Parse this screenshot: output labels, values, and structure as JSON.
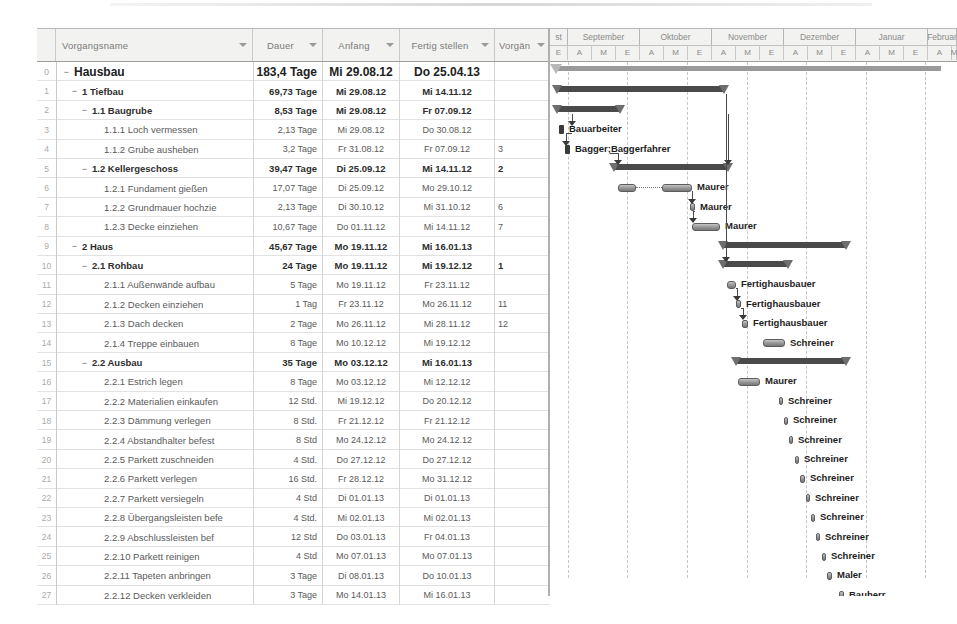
{
  "app": {
    "title": "Projektplan Hausbau - Gantt-Diagramm"
  },
  "table": {
    "columns": [
      {
        "key": "name",
        "label": "Vorgangsname",
        "filter_icon": "chevron-down-icon"
      },
      {
        "key": "dauer",
        "label": "Dauer",
        "filter_icon": "chevron-down-icon"
      },
      {
        "key": "anf",
        "label": "Anfang",
        "filter_icon": "chevron-down-icon"
      },
      {
        "key": "fert",
        "label": "Fertig stellen",
        "filter_icon": "chevron-down-icon"
      },
      {
        "key": "vorg",
        "label": "Vorgän",
        "filter_icon": "chevron-down-icon"
      }
    ],
    "rows": [
      {
        "idx": "0",
        "level": 0,
        "twist": "−",
        "name": "Hausbau",
        "dauer": "183,4 Tage",
        "anf": "Mi 29.08.12",
        "fert": "Do 25.04.13",
        "vorg": ""
      },
      {
        "idx": "1",
        "level": 1,
        "twist": "−",
        "name": "1 Tiefbau",
        "dauer": "69,73 Tage",
        "anf": "Mi 29.08.12",
        "fert": "Mi 14.11.12",
        "vorg": ""
      },
      {
        "idx": "2",
        "level": 2,
        "twist": "−",
        "name": "1.1 Baugrube",
        "dauer": "8,53 Tage",
        "anf": "Mi 29.08.12",
        "fert": "Fr 07.09.12",
        "vorg": ""
      },
      {
        "idx": "3",
        "level": 3,
        "twist": "",
        "name": "1.1.1 Loch vermessen",
        "dauer": "2,13 Tage",
        "anf": "Mi 29.08.12",
        "fert": "Do 30.08.12",
        "vorg": ""
      },
      {
        "idx": "4",
        "level": 3,
        "twist": "",
        "name": "1.1.2 Grube ausheben",
        "dauer": "3,2 Tage",
        "anf": "Fr 31.08.12",
        "fert": "Fr 07.09.12",
        "vorg": "3"
      },
      {
        "idx": "5",
        "level": 2,
        "twist": "−",
        "name": "1.2 Kellergeschoss",
        "dauer": "39,47 Tage",
        "anf": "Di 25.09.12",
        "fert": "Mi 14.11.12",
        "vorg": "2"
      },
      {
        "idx": "6",
        "level": 3,
        "twist": "",
        "name": "1.2.1 Fundament gießen",
        "dauer": "17,07 Tage",
        "anf": "Di 25.09.12",
        "fert": "Mo 29.10.12",
        "vorg": ""
      },
      {
        "idx": "7",
        "level": 3,
        "twist": "",
        "name": "1.2.2 Grundmauer hochzie",
        "dauer": "2,13 Tage",
        "anf": "Di 30.10.12",
        "fert": "Mi 31.10.12",
        "vorg": "6"
      },
      {
        "idx": "8",
        "level": 3,
        "twist": "",
        "name": "1.2.3 Decke einziehen",
        "dauer": "10,67 Tage",
        "anf": "Do 01.11.12",
        "fert": "Mi 14.11.12",
        "vorg": "7"
      },
      {
        "idx": "9",
        "level": 1,
        "twist": "−",
        "name": "2 Haus",
        "dauer": "45,67 Tage",
        "anf": "Mo 19.11.12",
        "fert": "Mi 16.01.13",
        "vorg": ""
      },
      {
        "idx": "10",
        "level": 2,
        "twist": "−",
        "name": "2.1 Rohbau",
        "dauer": "24 Tage",
        "anf": "Mo 19.11.12",
        "fert": "Mi 19.12.12",
        "vorg": "1"
      },
      {
        "idx": "11",
        "level": 3,
        "twist": "",
        "name": "2.1.1 Außenwände aufbau",
        "dauer": "5 Tage",
        "anf": "Mo 19.11.12",
        "fert": "Fr 23.11.12",
        "vorg": ""
      },
      {
        "idx": "12",
        "level": 3,
        "twist": "",
        "name": "2.1.2 Decken einziehen",
        "dauer": "1 Tag",
        "anf": "Fr 23.11.12",
        "fert": "Mo 26.11.12",
        "vorg": "11"
      },
      {
        "idx": "13",
        "level": 3,
        "twist": "",
        "name": "2.1.3 Dach decken",
        "dauer": "2 Tage",
        "anf": "Mo 26.11.12",
        "fert": "Mi 28.11.12",
        "vorg": "12"
      },
      {
        "idx": "14",
        "level": 3,
        "twist": "",
        "name": "2.1.4 Treppe einbauen",
        "dauer": "8 Tage",
        "anf": "Mo 10.12.12",
        "fert": "Mi 19.12.12",
        "vorg": ""
      },
      {
        "idx": "15",
        "level": 2,
        "twist": "−",
        "name": "2.2 Ausbau",
        "dauer": "35 Tage",
        "anf": "Mo 03.12.12",
        "fert": "Mi 16.01.13",
        "vorg": ""
      },
      {
        "idx": "16",
        "level": 3,
        "twist": "",
        "name": "2.2.1 Estrich legen",
        "dauer": "8 Tage",
        "anf": "Mo 03.12.12",
        "fert": "Mi 12.12.12",
        "vorg": ""
      },
      {
        "idx": "17",
        "level": 3,
        "twist": "",
        "name": "2.2.2 Materialien einkaufen",
        "dauer": "12 Std.",
        "anf": "Mi 19.12.12",
        "fert": "Do 20.12.12",
        "vorg": ""
      },
      {
        "idx": "18",
        "level": 3,
        "twist": "",
        "name": "2.2.3 Dämmung verlegen",
        "dauer": "8 Std.",
        "anf": "Fr 21.12.12",
        "fert": "Fr 21.12.12",
        "vorg": ""
      },
      {
        "idx": "19",
        "level": 3,
        "twist": "",
        "name": "2.2.4 Abstandhalter befest",
        "dauer": "8 Std",
        "anf": "Mo 24.12.12",
        "fert": "Mo 24.12.12",
        "vorg": ""
      },
      {
        "idx": "20",
        "level": 3,
        "twist": "",
        "name": "2.2.5 Parkett zuschneiden",
        "dauer": "4 Std.",
        "anf": "Do 27.12.12",
        "fert": "Do 27.12.12",
        "vorg": ""
      },
      {
        "idx": "21",
        "level": 3,
        "twist": "",
        "name": "2.2.6 Parkett verlegen",
        "dauer": "16 Std.",
        "anf": "Fr 28.12.12",
        "fert": "Mo 31.12.12",
        "vorg": ""
      },
      {
        "idx": "22",
        "level": 3,
        "twist": "",
        "name": "2.2.7 Parkett versiegeln",
        "dauer": "4 Std",
        "anf": "Di 01.01.13",
        "fert": "Di 01.01.13",
        "vorg": ""
      },
      {
        "idx": "23",
        "level": 3,
        "twist": "",
        "name": "2.2.8 Übergangsleisten befe",
        "dauer": "4 Std.",
        "anf": "Mi 02.01.13",
        "fert": "Mi 02.01.13",
        "vorg": ""
      },
      {
        "idx": "24",
        "level": 3,
        "twist": "",
        "name": "2.2.9 Abschlussleisten bef",
        "dauer": "12 Std",
        "anf": "Do 03.01.13",
        "fert": "Fr 04.01.13",
        "vorg": ""
      },
      {
        "idx": "25",
        "level": 3,
        "twist": "",
        "name": "2.2.10 Parkett reinigen",
        "dauer": "4 Std",
        "anf": "Mo 07.01.13",
        "fert": "Mo 07.01.13",
        "vorg": ""
      },
      {
        "idx": "26",
        "level": 3,
        "twist": "",
        "name": "2.2.11 Tapeten anbringen",
        "dauer": "3 Tage",
        "anf": "Di 08.01.13",
        "fert": "Do 10.01.13",
        "vorg": ""
      },
      {
        "idx": "27",
        "level": 3,
        "twist": "",
        "name": "2.2.12 Decken verkleiden",
        "dauer": "3 Tage",
        "anf": "Mo 14.01.13",
        "fert": "Mi 16.01.13",
        "vorg": ""
      }
    ]
  },
  "gantt": {
    "timeline": {
      "months": [
        {
          "label": "st",
          "left": 0,
          "width": 18
        },
        {
          "label": "September",
          "left": 18,
          "width": 72
        },
        {
          "label": "Oktober",
          "left": 90,
          "width": 72
        },
        {
          "label": "November",
          "left": 162,
          "width": 72
        },
        {
          "label": "Dezember",
          "left": 234,
          "width": 72
        },
        {
          "label": "Januar",
          "left": 306,
          "width": 72
        },
        {
          "label": "Februar",
          "left": 378,
          "width": 29
        }
      ],
      "periods": [
        {
          "label": "E",
          "left": 0,
          "width": 18
        },
        {
          "label": "A",
          "left": 18,
          "width": 24
        },
        {
          "label": "M",
          "left": 42,
          "width": 24
        },
        {
          "label": "E",
          "left": 66,
          "width": 24
        },
        {
          "label": "A",
          "left": 90,
          "width": 24
        },
        {
          "label": "M",
          "left": 114,
          "width": 24
        },
        {
          "label": "E",
          "left": 138,
          "width": 24
        },
        {
          "label": "A",
          "left": 162,
          "width": 24
        },
        {
          "label": "M",
          "left": 186,
          "width": 24
        },
        {
          "label": "E",
          "left": 210,
          "width": 24
        },
        {
          "label": "A",
          "left": 234,
          "width": 24
        },
        {
          "label": "M",
          "left": 258,
          "width": 24
        },
        {
          "label": "E",
          "left": 282,
          "width": 24
        },
        {
          "label": "A",
          "left": 306,
          "width": 24
        },
        {
          "label": "M",
          "left": 330,
          "width": 24
        },
        {
          "label": "E",
          "left": 354,
          "width": 24
        },
        {
          "label": "A",
          "left": 378,
          "width": 24
        },
        {
          "label": "M",
          "left": 402,
          "width": 5
        }
      ],
      "gridlines": [
        18,
        77,
        137,
        197,
        256,
        316,
        375
      ]
    },
    "bars": [
      {
        "row": 0,
        "type": "project",
        "left": 6,
        "width": 385,
        "label": ""
      },
      {
        "row": 1,
        "type": "summary",
        "left": 7,
        "width": 167,
        "label": ""
      },
      {
        "row": 2,
        "type": "summary",
        "left": 7,
        "width": 63,
        "label": ""
      },
      {
        "row": 3,
        "type": "milestone",
        "left": 9,
        "width": 5,
        "label": "Bauarbeiter"
      },
      {
        "row": 4,
        "type": "milestone",
        "left": 15,
        "width": 5,
        "label": "Bagger;Baggerfahrer"
      },
      {
        "row": 5,
        "type": "summary",
        "left": 64,
        "width": 114,
        "label": ""
      },
      {
        "row": 6,
        "type": "task",
        "left": 68,
        "width": 18,
        "label": "Maurer",
        "dotted": true,
        "dot_left": 86,
        "dot_width": 26,
        "bar2_left": 112,
        "bar2_width": 30
      },
      {
        "row": 7,
        "type": "task",
        "left": 140,
        "width": 5,
        "label": "Maurer"
      },
      {
        "row": 8,
        "type": "task",
        "left": 142,
        "width": 28,
        "label": "Maurer"
      },
      {
        "row": 9,
        "type": "summary",
        "left": 173,
        "width": 123,
        "label": ""
      },
      {
        "row": 10,
        "type": "summary",
        "left": 173,
        "width": 65,
        "label": ""
      },
      {
        "row": 11,
        "type": "task",
        "left": 177,
        "width": 9,
        "label": "Fertighausbauer"
      },
      {
        "row": 12,
        "type": "task",
        "left": 186,
        "width": 5,
        "label": "Fertighausbauer"
      },
      {
        "row": 13,
        "type": "task",
        "left": 192,
        "width": 6,
        "label": "Fertighausbauer"
      },
      {
        "row": 14,
        "type": "task",
        "left": 213,
        "width": 22,
        "label": "Schreiner"
      },
      {
        "row": 15,
        "type": "summary",
        "left": 186,
        "width": 110,
        "label": ""
      },
      {
        "row": 16,
        "type": "task",
        "left": 188,
        "width": 22,
        "label": "Maurer"
      },
      {
        "row": 17,
        "type": "task",
        "left": 229,
        "width": 4,
        "label": "Schreiner"
      },
      {
        "row": 18,
        "type": "task",
        "left": 234,
        "width": 4,
        "label": "Schreiner"
      },
      {
        "row": 19,
        "type": "task",
        "left": 239,
        "width": 4,
        "label": "Schreiner"
      },
      {
        "row": 20,
        "type": "task",
        "left": 245,
        "width": 4,
        "label": "Schreiner"
      },
      {
        "row": 21,
        "type": "task",
        "left": 250,
        "width": 5,
        "label": "Schreiner"
      },
      {
        "row": 22,
        "type": "task",
        "left": 256,
        "width": 4,
        "label": "Schreiner"
      },
      {
        "row": 23,
        "type": "task",
        "left": 261,
        "width": 4,
        "label": "Schreiner"
      },
      {
        "row": 24,
        "type": "task",
        "left": 266,
        "width": 4,
        "label": "Schreiner"
      },
      {
        "row": 25,
        "type": "task",
        "left": 272,
        "width": 4,
        "label": "Schreiner"
      },
      {
        "row": 26,
        "type": "task",
        "left": 277,
        "width": 5,
        "label": "Maler"
      },
      {
        "row": 27,
        "type": "task",
        "left": 289,
        "width": 5,
        "label": "Bauherr"
      }
    ]
  }
}
